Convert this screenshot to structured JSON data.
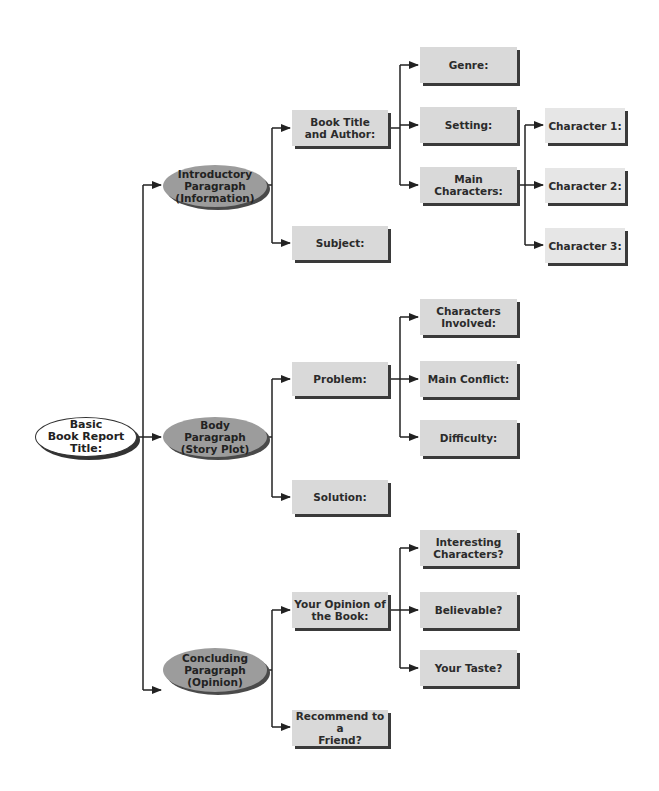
{
  "diagram": {
    "title": "Basic Book Report Title:",
    "root": {
      "label": "Basic\nBook Report\nTitle:"
    },
    "sections": [
      {
        "label": "Introductory\nParagraph\n(Information)",
        "children": [
          {
            "label": "Book Title\nand Author:",
            "children": [
              {
                "label": "Genre:"
              },
              {
                "label": "Setting:"
              },
              {
                "label": "Main Characters:",
                "children": [
                  {
                    "label": "Character 1:"
                  },
                  {
                    "label": "Character 2:"
                  },
                  {
                    "label": "Character 3:"
                  }
                ]
              }
            ]
          },
          {
            "label": "Subject:"
          }
        ]
      },
      {
        "label": "Body\nParagraph\n(Story Plot)",
        "children": [
          {
            "label": "Problem:",
            "children": [
              {
                "label": "Characters\nInvolved:"
              },
              {
                "label": "Main Conflict:"
              },
              {
                "label": "Difficulty:"
              }
            ]
          },
          {
            "label": "Solution:"
          }
        ]
      },
      {
        "label": "Concluding\nParagraph\n(Opinion)",
        "children": [
          {
            "label": "Your Opinion of\nthe Book:",
            "children": [
              {
                "label": "Interesting\nCharacters?"
              },
              {
                "label": "Believable?"
              },
              {
                "label": "Your Taste?"
              }
            ]
          },
          {
            "label": "Recommend to a\nFriend?"
          }
        ]
      }
    ],
    "colors": {
      "ellipse_fill": "#9c9c9c",
      "box_fill": "#d9d9d9",
      "shadow": "#3a3a3a",
      "line": "#222222",
      "root_fill": "#ffffff"
    }
  }
}
